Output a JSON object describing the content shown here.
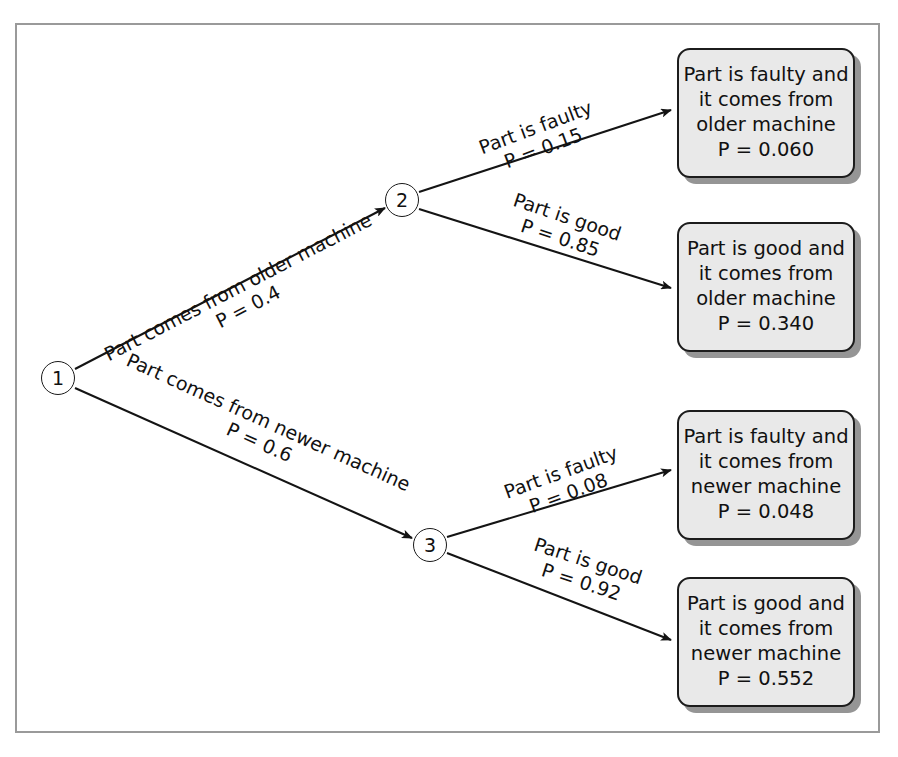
{
  "diagram": {
    "type": "probability-tree",
    "title": "",
    "background_color": "#ffffff",
    "frame_color": "#9a9a9a",
    "box_fill": "#e9e9e9",
    "box_border": "#1c1c1c",
    "shadow_color": "#828282",
    "nodes": [
      {
        "id": "1",
        "label": "1",
        "x": 58,
        "y": 378
      },
      {
        "id": "2",
        "label": "2",
        "x": 402,
        "y": 200
      },
      {
        "id": "3",
        "label": "3",
        "x": 430,
        "y": 545
      }
    ],
    "edges": [
      {
        "id": "e1",
        "from": "1",
        "to": "2",
        "text": "Part comes from older machine",
        "prob_text": "P = 0.4",
        "probability": 0.4,
        "x": 253,
        "y": 316,
        "rotate": -27.4
      },
      {
        "id": "e2",
        "from": "1",
        "to": "3",
        "text": "Part comes from newer machine",
        "prob_text": "P = 0.6",
        "probability": 0.6,
        "x": 255,
        "y": 452,
        "rotate": 24.2
      },
      {
        "id": "e3",
        "from": "2",
        "to": "box1",
        "text": "Part is faulty",
        "prob_text": "P = 0.15",
        "probability": 0.15,
        "x": 547,
        "y": 158,
        "rotate": -20.5
      },
      {
        "id": "e4",
        "from": "2",
        "to": "box2",
        "text": "Part is good",
        "prob_text": "P = 0.85",
        "probability": 0.85,
        "x": 557,
        "y": 248,
        "rotate": 18.5
      },
      {
        "id": "e5",
        "from": "3",
        "to": "box3",
        "text": "Part is faulty",
        "prob_text": "P = 0.08",
        "probability": 0.08,
        "x": 572,
        "y": 503,
        "rotate": -20.0
      },
      {
        "id": "e6",
        "from": "3",
        "to": "box4",
        "text": "Part is good",
        "prob_text": "P = 0.92",
        "probability": 0.92,
        "x": 578,
        "y": 592,
        "rotate": 18.0
      }
    ],
    "outcomes": [
      {
        "id": "box1",
        "line1": "Part is faulty and",
        "line2": "it comes from",
        "line3": "older machine",
        "prob_text": "P = 0.060",
        "probability": 0.06,
        "x": 677,
        "y": 48
      },
      {
        "id": "box2",
        "line1": "Part is good and",
        "line2": "it comes from",
        "line3": "older machine",
        "prob_text": "P = 0.340",
        "probability": 0.34,
        "x": 677,
        "y": 222
      },
      {
        "id": "box3",
        "line1": "Part is faulty and",
        "line2": "it comes from",
        "line3": "newer machine",
        "prob_text": "P = 0.048",
        "probability": 0.048,
        "x": 677,
        "y": 410
      },
      {
        "id": "box4",
        "line1": "Part is good and",
        "line2": "it comes from",
        "line3": "newer machine",
        "prob_text": "P = 0.552",
        "probability": 0.552,
        "x": 677,
        "y": 577
      }
    ]
  }
}
